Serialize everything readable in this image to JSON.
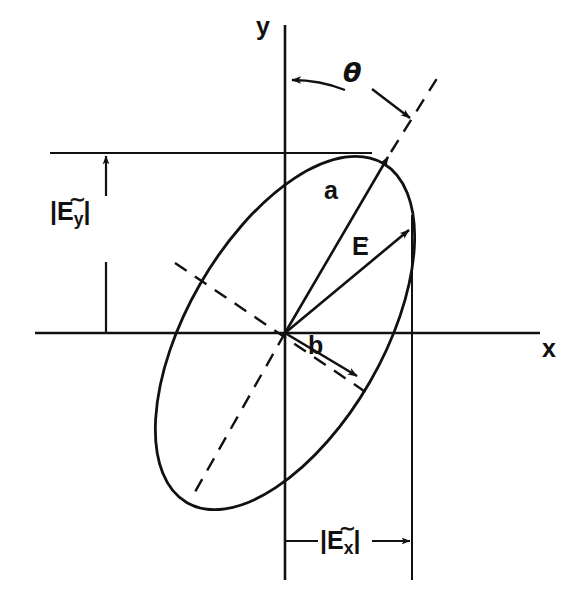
{
  "figure": {
    "background": "#ffffff",
    "ink": "#111111"
  },
  "axes": {
    "x_label": "x",
    "y_label": "y",
    "origin": {
      "x": 285,
      "y": 333
    },
    "x_axis": {
      "x1": 35,
      "y1": 333,
      "x2": 540,
      "y2": 333
    },
    "y_axis": {
      "x1": 285,
      "y1": 25,
      "x2": 285,
      "y2": 580
    },
    "x_label_pos": {
      "x": 543,
      "y": 338
    },
    "y_label_pos": {
      "x": 258,
      "y": 18
    }
  },
  "ellipse": {
    "center": {
      "x": 285,
      "y": 333
    },
    "semi_major": 196,
    "semi_minor": 98,
    "rotation_deg": -60,
    "tilt_from_y_axis_deg": 30
  },
  "angle": {
    "symbol": "θ",
    "label_pos": {
      "x": 345,
      "y": 72
    },
    "description": "angle between y-axis and major axis"
  },
  "vectors": [
    {
      "name": "semi-major-axis",
      "label": "a",
      "label_pos": {
        "x": 325,
        "y": 190
      },
      "from": {
        "x": 285,
        "y": 333
      },
      "to": {
        "x": 387,
        "y": 158
      }
    },
    {
      "name": "electric-field",
      "label": "E",
      "label_pos": {
        "x": 354,
        "y": 246
      },
      "has_arrow_overbar": true,
      "from": {
        "x": 285,
        "y": 333
      },
      "to": {
        "x": 408,
        "y": 231
      }
    },
    {
      "name": "semi-minor-axis",
      "label": "b",
      "label_pos": {
        "x": 310,
        "y": 344
      },
      "from": {
        "x": 285,
        "y": 333
      },
      "to": {
        "x": 356,
        "y": 375
      }
    }
  ],
  "measurements": [
    {
      "name": "Ey-magnitude",
      "text_main": "E",
      "tilde": "∼",
      "subscript": "y",
      "bar_left": "|",
      "bar_right": "|",
      "label_pos": {
        "x": 52,
        "y": 212
      },
      "guide_line": {
        "x1": 50,
        "y1": 153,
        "x2": 372,
        "y2": 153
      },
      "arrow_line": {
        "x": 106,
        "y_top": 153,
        "y_bottom": 333
      }
    },
    {
      "name": "Ex-magnitude",
      "text_main": "E",
      "tilde": "∼",
      "subscript": "x",
      "bar_left": "|",
      "bar_right": "|",
      "label_pos": {
        "x": 320,
        "y": 525
      },
      "guide_line": {
        "x1": 412,
        "y1": 215,
        "x2": 412,
        "y2": 580
      },
      "arrow_line": {
        "y": 541,
        "x_left": 285,
        "x_right": 412
      }
    }
  ],
  "dashed_lines": [
    {
      "name": "major-axis-dashed-upper",
      "x1": 393,
      "y1": 148,
      "x2": 440,
      "y2": 73
    },
    {
      "name": "major-axis-dashed-lower",
      "x1": 285,
      "y1": 333,
      "x2": 192,
      "y2": 497
    },
    {
      "name": "minor-axis-dashed",
      "x1": 176,
      "y1": 264,
      "x2": 372,
      "y2": 396
    }
  ]
}
